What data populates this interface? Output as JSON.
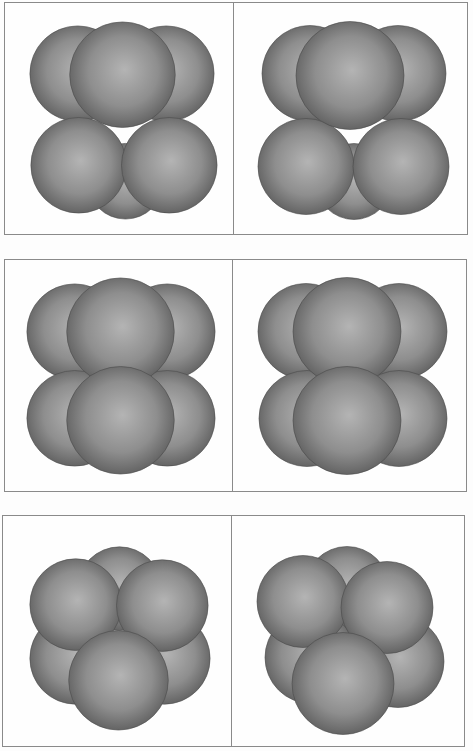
{
  "figure": {
    "colors": {
      "background": "#fdfdfd",
      "frame": "#8a8a8a",
      "sphere_light": "#b4b4b4",
      "sphere_mid": "#8e8e8e",
      "sphere_dark": "#5e5e5e",
      "sphere_edge": "#4a4a4a"
    },
    "rows": [
      {
        "id": "row-1",
        "box": {
          "x": 4,
          "y": 2,
          "w": 464,
          "h": 233
        },
        "split": 229,
        "panels": [
          {
            "side": "left",
            "spheres": [
              {
                "cx": 73,
                "cy": 70,
                "r": 48
              },
              {
                "cx": 162,
                "cy": 70,
                "r": 48
              },
              {
                "cx": 121,
                "cy": 178,
                "r": 38
              },
              {
                "cx": 74,
                "cy": 162,
                "r": 48
              },
              {
                "cx": 165,
                "cy": 162,
                "r": 48
              },
              {
                "cx": 118,
                "cy": 71,
                "r": 53
              }
            ]
          },
          {
            "side": "right",
            "spheres": [
              {
                "cx": 75,
                "cy": 70,
                "r": 48
              },
              {
                "cx": 163,
                "cy": 70,
                "r": 48
              },
              {
                "cx": 119,
                "cy": 178,
                "r": 38
              },
              {
                "cx": 71,
                "cy": 163,
                "r": 48
              },
              {
                "cx": 166,
                "cy": 163,
                "r": 48
              },
              {
                "cx": 115,
                "cy": 72,
                "r": 54
              }
            ]
          }
        ]
      },
      {
        "id": "row-2",
        "box": {
          "x": 4,
          "y": 259,
          "w": 463,
          "h": 233
        },
        "split": 228,
        "panels": [
          {
            "side": "left",
            "spheres": [
              {
                "cx": 70,
                "cy": 71,
                "r": 48
              },
              {
                "cx": 163,
                "cy": 71,
                "r": 48
              },
              {
                "cx": 70,
                "cy": 158,
                "r": 48
              },
              {
                "cx": 163,
                "cy": 158,
                "r": 48
              },
              {
                "cx": 116,
                "cy": 71,
                "r": 54
              },
              {
                "cx": 116,
                "cy": 160,
                "r": 54
              }
            ]
          },
          {
            "side": "right",
            "spheres": [
              {
                "cx": 72,
                "cy": 71,
                "r": 48
              },
              {
                "cx": 165,
                "cy": 71,
                "r": 48
              },
              {
                "cx": 73,
                "cy": 158,
                "r": 48
              },
              {
                "cx": 165,
                "cy": 158,
                "r": 48
              },
              {
                "cx": 113,
                "cy": 71,
                "r": 54
              },
              {
                "cx": 113,
                "cy": 160,
                "r": 54
              }
            ]
          }
        ]
      },
      {
        "id": "row-3",
        "box": {
          "x": 2,
          "y": 515,
          "w": 463,
          "h": 232
        },
        "split": 229,
        "panels": [
          {
            "side": "left",
            "spheres": [
              {
                "cx": 117,
                "cy": 72,
                "r": 42
              },
              {
                "cx": 73,
                "cy": 142,
                "r": 46
              },
              {
                "cx": 162,
                "cy": 142,
                "r": 46
              },
              {
                "cx": 73,
                "cy": 88,
                "r": 46
              },
              {
                "cx": 160,
                "cy": 89,
                "r": 46
              },
              {
                "cx": 116,
                "cy": 164,
                "r": 50
              }
            ]
          },
          {
            "side": "right",
            "spheres": [
              {
                "cx": 114,
                "cy": 72,
                "r": 42
              },
              {
                "cx": 78,
                "cy": 141,
                "r": 46
              },
              {
                "cx": 165,
                "cy": 145,
                "r": 46
              },
              {
                "cx": 70,
                "cy": 85,
                "r": 46
              },
              {
                "cx": 154,
                "cy": 91,
                "r": 46
              },
              {
                "cx": 110,
                "cy": 167,
                "r": 51
              }
            ]
          }
        ]
      }
    ]
  }
}
